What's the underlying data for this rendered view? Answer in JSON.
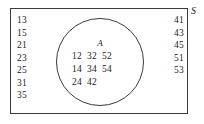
{
  "figure": {
    "type": "venn-diagram",
    "universe_label": "S",
    "set_label": "A"
  },
  "set_a": {
    "label": "A",
    "rows": [
      "12  32  52",
      "14  34  54",
      "24  42"
    ],
    "members": [
      12,
      32,
      52,
      14,
      34,
      54,
      24,
      42
    ]
  },
  "outside_left": {
    "items": [
      "13",
      "15",
      "21",
      "23",
      "25",
      "31",
      "35"
    ]
  },
  "outside_right": {
    "items": [
      "41",
      "43",
      "45",
      "51",
      "53"
    ]
  },
  "colors": {
    "stroke": "#3a3a3a",
    "text": "#1a1a1a",
    "background": "#ffffff"
  }
}
